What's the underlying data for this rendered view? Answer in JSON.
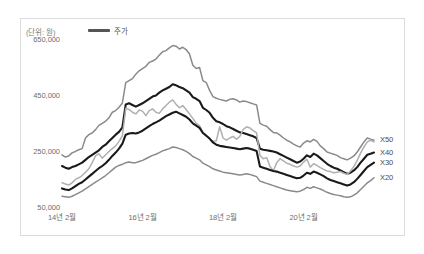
{
  "figure": {
    "unit_note": "(단위: 원)",
    "legend": [
      {
        "label": "주가",
        "color": "#555555"
      }
    ]
  },
  "chart_data": {
    "type": "line",
    "title": "",
    "xlabel": "",
    "ylabel": "",
    "unit": "(단위: 원)",
    "grid": false,
    "legend_position": "top-left",
    "ylim": [
      50000,
      650000
    ],
    "yticks": [
      650000,
      450000,
      250000,
      50000
    ],
    "ytick_labels": [
      "650,000",
      "450,000",
      "250,000",
      "50,000"
    ],
    "xticks": [
      0,
      24,
      48,
      72
    ],
    "xtick_labels": [
      "14년 2월",
      "16년 2월",
      "18년 2월",
      "20년 2월"
    ],
    "x_start_label": "14년 2월",
    "x_end_label": "21년 중반",
    "series": [
      {
        "name": "X50",
        "color": "#8a8a8a",
        "end_label": "X50",
        "values": [
          240000,
          232000,
          236000,
          247000,
          252000,
          258000,
          262000,
          300000,
          312000,
          318000,
          330000,
          345000,
          352000,
          360000,
          372000,
          392000,
          398000,
          410000,
          425000,
          498000,
          505000,
          512000,
          528000,
          540000,
          548000,
          556000,
          570000,
          575000,
          582000,
          596000,
          608000,
          612000,
          622000,
          630000,
          628000,
          618000,
          624000,
          616000,
          600000,
          560000,
          548000,
          552000,
          505000,
          498000,
          470000,
          448000,
          442000,
          438000,
          435000,
          432000,
          438000,
          440000,
          436000,
          428000,
          432000,
          430000,
          426000,
          422000,
          418000,
          352000,
          346000,
          342000,
          330000,
          320000,
          318000,
          310000,
          300000,
          292000,
          286000,
          278000,
          272000,
          268000,
          282000,
          290000,
          286000,
          295000,
          288000,
          272000,
          262000,
          250000,
          246000,
          242000,
          238000,
          230000,
          226000,
          222000,
          228000,
          236000,
          250000,
          268000,
          286000,
          300000,
          296000,
          292000
        ]
      },
      {
        "name": "X40",
        "color": "#1a1a1a",
        "end_label": "X40",
        "values": [
          200000,
          194000,
          190000,
          196000,
          200000,
          206000,
          212000,
          222000,
          232000,
          240000,
          248000,
          256000,
          268000,
          276000,
          288000,
          300000,
          312000,
          322000,
          338000,
          420000,
          424000,
          418000,
          412000,
          418000,
          424000,
          432000,
          440000,
          448000,
          452000,
          462000,
          470000,
          476000,
          482000,
          492000,
          488000,
          482000,
          478000,
          470000,
          462000,
          446000,
          440000,
          432000,
          408000,
          400000,
          390000,
          372000,
          360000,
          356000,
          350000,
          342000,
          338000,
          332000,
          326000,
          320000,
          318000,
          314000,
          310000,
          306000,
          300000,
          262000,
          258000,
          256000,
          254000,
          252000,
          248000,
          242000,
          236000,
          230000,
          224000,
          218000,
          212000,
          216000,
          226000,
          238000,
          232000,
          244000,
          238000,
          228000,
          218000,
          208000,
          200000,
          194000,
          190000,
          184000,
          178000,
          172000,
          176000,
          184000,
          196000,
          212000,
          226000,
          240000,
          244000,
          248000
        ]
      },
      {
        "name": "주가",
        "color": "#b0b0b0",
        "end_label": "",
        "values": [
          140000,
          136000,
          132000,
          140000,
          152000,
          158000,
          166000,
          178000,
          190000,
          212000,
          236000,
          244000,
          228000,
          240000,
          252000,
          262000,
          272000,
          288000,
          308000,
          406000,
          402000,
          392000,
          386000,
          400000,
          396000,
          380000,
          398000,
          404000,
          392000,
          388000,
          404000,
          416000,
          428000,
          436000,
          420000,
          408000,
          416000,
          402000,
          386000,
          370000,
          352000,
          344000,
          320000,
          310000,
          296000,
          288000,
          290000,
          340000,
          300000,
          292000,
          300000,
          306000,
          296000,
          306000,
          330000,
          340000,
          336000,
          326000,
          318000,
          238000,
          226000,
          230000,
          198000,
          182000,
          212000,
          226000,
          218000,
          210000,
          206000,
          200000,
          196000,
          200000,
          214000,
          224000,
          196000,
          208000,
          202000,
          194000,
          188000,
          182000,
          180000,
          176000,
          178000,
          180000,
          174000,
          170000,
          182000,
          198000,
          220000,
          246000,
          268000,
          286000,
          292000,
          286000
        ]
      },
      {
        "name": "X30",
        "color": "#1a1a1a",
        "end_label": "X30",
        "values": [
          120000,
          116000,
          114000,
          120000,
          128000,
          136000,
          142000,
          152000,
          162000,
          172000,
          182000,
          192000,
          200000,
          210000,
          222000,
          236000,
          248000,
          262000,
          280000,
          312000,
          316000,
          318000,
          316000,
          320000,
          326000,
          334000,
          342000,
          350000,
          356000,
          362000,
          370000,
          378000,
          384000,
          390000,
          394000,
          388000,
          382000,
          376000,
          366000,
          352000,
          344000,
          336000,
          318000,
          308000,
          298000,
          284000,
          276000,
          272000,
          270000,
          268000,
          266000,
          264000,
          262000,
          260000,
          262000,
          264000,
          262000,
          258000,
          254000,
          198000,
          194000,
          190000,
          186000,
          182000,
          180000,
          176000,
          172000,
          168000,
          164000,
          160000,
          156000,
          158000,
          166000,
          176000,
          172000,
          180000,
          176000,
          170000,
          164000,
          156000,
          150000,
          146000,
          142000,
          138000,
          134000,
          130000,
          134000,
          142000,
          154000,
          168000,
          182000,
          196000,
          204000,
          212000
        ]
      },
      {
        "name": "X20",
        "color": "#8a8a8a",
        "end_label": "X20",
        "values": [
          92000,
          90000,
          88000,
          92000,
          98000,
          104000,
          110000,
          118000,
          126000,
          134000,
          142000,
          150000,
          158000,
          166000,
          176000,
          186000,
          196000,
          202000,
          206000,
          212000,
          214000,
          212000,
          212000,
          216000,
          220000,
          226000,
          232000,
          238000,
          242000,
          248000,
          254000,
          258000,
          262000,
          268000,
          266000,
          262000,
          258000,
          252000,
          244000,
          234000,
          228000,
          222000,
          210000,
          204000,
          198000,
          190000,
          186000,
          182000,
          178000,
          176000,
          174000,
          172000,
          170000,
          168000,
          170000,
          172000,
          170000,
          166000,
          162000,
          146000,
          142000,
          138000,
          134000,
          130000,
          126000,
          122000,
          118000,
          114000,
          112000,
          110000,
          108000,
          110000,
          116000,
          124000,
          120000,
          126000,
          122000,
          118000,
          112000,
          106000,
          102000,
          98000,
          96000,
          94000,
          90000,
          88000,
          90000,
          96000,
          104000,
          116000,
          128000,
          140000,
          148000,
          158000
        ]
      }
    ]
  }
}
